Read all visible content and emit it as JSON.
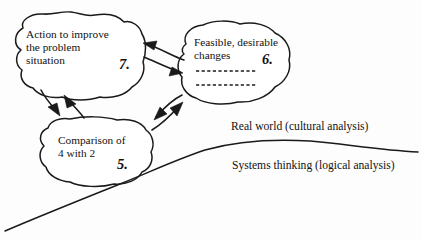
{
  "diagram": {
    "line_color": "#1a1a1a",
    "background_color": "#fdfdfd",
    "nodes": [
      {
        "id": "action",
        "number": "7.",
        "lines": [
          "Action to improve",
          "the problem",
          "situation"
        ],
        "shape": "cloud-blob"
      },
      {
        "id": "feasible",
        "number": "6.",
        "lines": [
          "Feasible, desirable",
          "changes"
        ],
        "shape": "cloud-blob",
        "dashed_rules": 2
      },
      {
        "id": "comparison",
        "number": "5.",
        "lines": [
          "Comparison of",
          "4 with 2"
        ],
        "shape": "cloud-blob"
      }
    ],
    "zones": {
      "above": "Real world (cultural analysis)",
      "below": "Systems thinking (logical analysis)"
    },
    "connectors": [
      {
        "from": "feasible",
        "to": "action",
        "style": "arrow"
      },
      {
        "from": "action",
        "to": "feasible",
        "style": "arrow"
      },
      {
        "from": "action",
        "to": "comparison",
        "style": "arrow"
      },
      {
        "from": "comparison",
        "to": "action",
        "style": "arrow"
      },
      {
        "from": "feasible",
        "to": "comparison",
        "style": "arrow"
      },
      {
        "from": "comparison",
        "to": "feasible",
        "style": "arrow"
      }
    ]
  }
}
